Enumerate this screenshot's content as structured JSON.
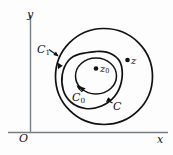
{
  "figure": {
    "caption_title": "Nested contours about z0",
    "background_color": "#fdfdfd",
    "curve_color": "#111111",
    "axis_color": "#777d80"
  },
  "axes": {
    "x_label": "x",
    "y_label": "y",
    "origin_label": "O"
  },
  "contours": [
    {
      "id": "C1",
      "label_main": "C",
      "label_sub": "1",
      "kind": "outer-circle"
    },
    {
      "id": "C",
      "label_main": "C",
      "label_sub": "",
      "kind": "middle-blob"
    },
    {
      "id": "C0",
      "label_main": "C",
      "label_sub": "0",
      "kind": "inner-circle"
    }
  ],
  "points": [
    {
      "id": "z0",
      "label_main": "z",
      "label_sub": "0"
    },
    {
      "id": "z",
      "label_main": "z",
      "label_sub": ""
    }
  ]
}
